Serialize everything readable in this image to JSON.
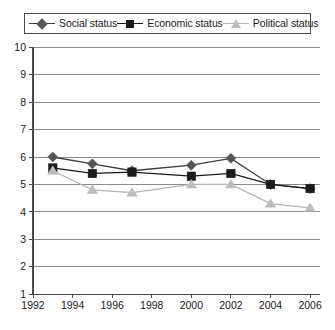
{
  "chart_data": {
    "type": "line",
    "title": "",
    "subtitle": "",
    "xlabel": "",
    "ylabel": "",
    "xlim": [
      1992,
      2006
    ],
    "ylim": [
      1,
      10
    ],
    "grid": true,
    "grid_axis": "y",
    "legend_position": "top",
    "x_tick_labels": [
      "1992",
      "1994",
      "1996",
      "1998",
      "2000",
      "2002",
      "2004",
      "2006"
    ],
    "x_ticks": [
      1992,
      1994,
      1996,
      1998,
      2000,
      2002,
      2004,
      2006
    ],
    "y_tick_labels": [
      "1",
      "2",
      "3",
      "4",
      "5",
      "6",
      "7",
      "8",
      "9",
      "10"
    ],
    "y_ticks": [
      1,
      2,
      3,
      4,
      5,
      6,
      7,
      8,
      9,
      10
    ],
    "x": [
      1993,
      1995,
      1997,
      2000,
      2002,
      2004,
      2006
    ],
    "series": [
      {
        "name": "Social status",
        "marker": "diamond",
        "color": "#555555",
        "line_color": "#3c3c3c",
        "values": [
          6.0,
          5.75,
          5.5,
          5.7,
          5.95,
          5.0,
          4.85
        ]
      },
      {
        "name": "Economic status",
        "marker": "square",
        "color": "#1a1a1a",
        "line_color": "#1a1a1a",
        "values": [
          5.6,
          5.4,
          5.45,
          5.3,
          5.4,
          5.0,
          4.85
        ]
      },
      {
        "name": "Political status",
        "marker": "triangle",
        "color": "#bdbdbd",
        "line_color": "#b5b5b5",
        "values": [
          5.5,
          4.8,
          4.7,
          5.0,
          5.0,
          4.3,
          4.15
        ]
      }
    ]
  },
  "legend": {
    "items": [
      {
        "label": "Social status",
        "marker": "diamond-marker",
        "color": "#555555"
      },
      {
        "label": "Economic status",
        "marker": "square-marker",
        "color": "#1a1a1a"
      },
      {
        "label": "Political status",
        "marker": "triangle-marker",
        "color": "#bdbdbd"
      }
    ]
  },
  "style": {
    "background": "#ffffff",
    "axis_color": "#4a4a4a",
    "grid_color": "#8c8c8c",
    "text_color": "#1a1a1a"
  }
}
